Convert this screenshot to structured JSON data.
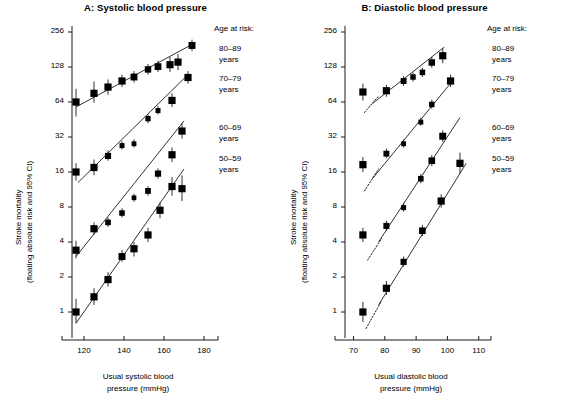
{
  "figure": {
    "ytitle_line1": "Stroke mortality",
    "ytitle_line2": "(floating absolute risk and 95% CI)",
    "legend_heading": "Age at risk:"
  },
  "panels": [
    {
      "id": "A",
      "title": "A: Systolic blood pressure",
      "xtitle_line1": "Usual systolic blood",
      "xtitle_line2": "pressure (mmHg)",
      "xticks": [
        120,
        140,
        160,
        180
      ],
      "yticks": [
        256,
        128,
        64,
        32,
        16,
        8,
        4,
        2,
        1
      ]
    },
    {
      "id": "B",
      "title": "B: Diastolic blood pressure",
      "xtitle_line1": "Usual diastolic blood",
      "xtitle_line2": "pressure (mmHg)",
      "xticks": [
        70,
        80,
        90,
        100,
        110
      ],
      "yticks": [
        256,
        128,
        64,
        32,
        16,
        8,
        4,
        2,
        1
      ]
    }
  ],
  "legend": [
    {
      "range": "80–89",
      "unit": "years"
    },
    {
      "range": "70–79",
      "unit": "years"
    },
    {
      "range": "60–69",
      "unit": "years"
    },
    {
      "range": "50–59",
      "unit": "years"
    }
  ],
  "chart_data": {
    "type": "scatter",
    "ylabel": "Stroke mortality (floating absolute risk and 95% CI)",
    "yscale": "log2",
    "ylim": [
      0.75,
      330
    ],
    "yticks": [
      1,
      2,
      4,
      8,
      16,
      32,
      64,
      128,
      256
    ],
    "grid": false,
    "legend_position": "right",
    "panels": [
      {
        "id": "A",
        "title": "A: Systolic blood pressure",
        "xlabel": "Usual systolic blood pressure (mmHg)",
        "xlim": [
          112,
          184
        ],
        "xticks": [
          120,
          140,
          160,
          180
        ],
        "series": [
          {
            "name": "80–89 years",
            "fit_line": {
              "x": [
                116,
                174
              ],
              "y": [
                58,
                200
              ]
            },
            "points": [
              {
                "x": 116,
                "y": 64,
                "ci_low": 48,
                "ci_high": 83
              },
              {
                "x": 125,
                "y": 76,
                "ci_low": 63,
                "ci_high": 96
              },
              {
                "x": 132,
                "y": 86,
                "ci_low": 74,
                "ci_high": 100
              },
              {
                "x": 139,
                "y": 97,
                "ci_low": 86,
                "ci_high": 110
              },
              {
                "x": 145,
                "y": 105,
                "ci_low": 94,
                "ci_high": 118
              },
              {
                "x": 152,
                "y": 122,
                "ci_low": 110,
                "ci_high": 136
              },
              {
                "x": 157,
                "y": 129,
                "ci_low": 116,
                "ci_high": 145
              },
              {
                "x": 163,
                "y": 134,
                "ci_low": 116,
                "ci_high": 156
              },
              {
                "x": 167,
                "y": 141,
                "ci_low": 120,
                "ci_high": 165
              },
              {
                "x": 174,
                "y": 196,
                "ci_low": 175,
                "ci_high": 220
              }
            ]
          },
          {
            "name": "70–79 years",
            "fit_line": {
              "x": [
                117,
                172
              ],
              "y": [
                13,
                110
              ]
            },
            "points": [
              {
                "x": 116,
                "y": 16,
                "ci_low": 13.5,
                "ci_high": 19
              },
              {
                "x": 125,
                "y": 17.5,
                "ci_low": 15,
                "ci_high": 20.5
              },
              {
                "x": 132,
                "y": 22,
                "ci_low": 20,
                "ci_high": 24.5
              },
              {
                "x": 139,
                "y": 27,
                "ci_low": 25,
                "ci_high": 29.5
              },
              {
                "x": 145,
                "y": 28,
                "ci_low": 26,
                "ci_high": 30.5
              },
              {
                "x": 152,
                "y": 46,
                "ci_low": 42,
                "ci_high": 50
              },
              {
                "x": 157,
                "y": 54,
                "ci_low": 50,
                "ci_high": 59
              },
              {
                "x": 164,
                "y": 66,
                "ci_low": 58,
                "ci_high": 76
              },
              {
                "x": 172,
                "y": 104,
                "ci_low": 92,
                "ci_high": 118
              }
            ]
          },
          {
            "name": "60–69 years",
            "fit_line": {
              "x": [
                116,
                170
              ],
              "y": [
                3.0,
                44
              ]
            },
            "points": [
              {
                "x": 116,
                "y": 3.4,
                "ci_low": 2.9,
                "ci_high": 4.1
              },
              {
                "x": 125,
                "y": 5.2,
                "ci_low": 4.6,
                "ci_high": 5.9
              },
              {
                "x": 132,
                "y": 5.9,
                "ci_low": 5.4,
                "ci_high": 6.5
              },
              {
                "x": 139,
                "y": 7.1,
                "ci_low": 6.5,
                "ci_high": 7.8
              },
              {
                "x": 145,
                "y": 9.6,
                "ci_low": 8.9,
                "ci_high": 10.4
              },
              {
                "x": 152,
                "y": 11.0,
                "ci_low": 10.0,
                "ci_high": 12.1
              },
              {
                "x": 157,
                "y": 15.5,
                "ci_low": 14.0,
                "ci_high": 17.2
              },
              {
                "x": 164,
                "y": 22.5,
                "ci_low": 19.5,
                "ci_high": 26.0
              },
              {
                "x": 169,
                "y": 36,
                "ci_low": 31,
                "ci_high": 42
              }
            ]
          },
          {
            "name": "50–59 years",
            "fit_line": {
              "x": [
                116,
                170
              ],
              "y": [
                0.8,
                17
              ]
            },
            "points": [
              {
                "x": 116,
                "y": 1.0,
                "ci_low": 0.8,
                "ci_high": 1.3
              },
              {
                "x": 125,
                "y": 1.35,
                "ci_low": 1.15,
                "ci_high": 1.6
              },
              {
                "x": 132,
                "y": 1.9,
                "ci_low": 1.65,
                "ci_high": 2.2
              },
              {
                "x": 139,
                "y": 3.0,
                "ci_low": 2.7,
                "ci_high": 3.4
              },
              {
                "x": 145,
                "y": 3.5,
                "ci_low": 3.0,
                "ci_high": 4.0
              },
              {
                "x": 152,
                "y": 4.6,
                "ci_low": 4.0,
                "ci_high": 5.3
              },
              {
                "x": 158,
                "y": 7.5,
                "ci_low": 6.4,
                "ci_high": 8.8
              },
              {
                "x": 164,
                "y": 12.0,
                "ci_low": 10.0,
                "ci_high": 14.5
              },
              {
                "x": 169,
                "y": 11.5,
                "ci_low": 9.0,
                "ci_high": 15.0
              }
            ]
          }
        ]
      },
      {
        "id": "B",
        "title": "B: Diastolic blood pressure",
        "xlabel": "Usual diastolic blood pressure (mmHg)",
        "xlim": [
          66,
          112
        ],
        "xticks": [
          70,
          80,
          90,
          100,
          110
        ],
        "series": [
          {
            "name": "80–89 years",
            "fit_line": {
              "x": [
                76,
                99
              ],
              "y": [
                62,
                190
              ]
            },
            "fit_dotted": {
              "x": [
                73.5,
                78
              ],
              "y": [
                52,
                72
              ]
            },
            "points": [
              {
                "x": 73,
                "y": 78,
                "ci_low": 66,
                "ci_high": 92
              },
              {
                "x": 80.5,
                "y": 80,
                "ci_low": 71,
                "ci_high": 90
              },
              {
                "x": 86,
                "y": 97,
                "ci_low": 88,
                "ci_high": 107
              },
              {
                "x": 89,
                "y": 105,
                "ci_low": 96,
                "ci_high": 115
              },
              {
                "x": 92,
                "y": 115,
                "ci_low": 105,
                "ci_high": 126
              },
              {
                "x": 95,
                "y": 140,
                "ci_low": 126,
                "ci_high": 156
              },
              {
                "x": 98.5,
                "y": 160,
                "ci_low": 138,
                "ci_high": 186
              }
            ]
          },
          {
            "name": "70–79 years",
            "fit_line": {
              "x": [
                76,
                102
              ],
              "y": [
                14,
                100
              ]
            },
            "fit_dotted": {
              "x": [
                73.5,
                78
              ],
              "y": [
                11,
                17
              ]
            },
            "points": [
              {
                "x": 73,
                "y": 18.5,
                "ci_low": 16.0,
                "ci_high": 21.5
              },
              {
                "x": 80.5,
                "y": 23,
                "ci_low": 21.0,
                "ci_high": 25.5
              },
              {
                "x": 86,
                "y": 28,
                "ci_low": 26.0,
                "ci_high": 30.5
              },
              {
                "x": 91.5,
                "y": 43,
                "ci_low": 40.0,
                "ci_high": 47.0
              },
              {
                "x": 95,
                "y": 61,
                "ci_low": 56.0,
                "ci_high": 67.0
              },
              {
                "x": 101,
                "y": 97,
                "ci_low": 86.0,
                "ci_high": 110.0
              }
            ]
          },
          {
            "name": "60–69 years",
            "fit_line": {
              "x": [
                78,
                104
              ],
              "y": [
                4.0,
                47
              ]
            },
            "fit_dotted": {
              "x": [
                74.5,
                79
              ],
              "y": [
                2.8,
                4.3
              ]
            },
            "points": [
              {
                "x": 73,
                "y": 4.6,
                "ci_low": 4.0,
                "ci_high": 5.3
              },
              {
                "x": 80.5,
                "y": 5.5,
                "ci_low": 5.0,
                "ci_high": 6.1
              },
              {
                "x": 86,
                "y": 7.9,
                "ci_low": 7.3,
                "ci_high": 8.6
              },
              {
                "x": 91.5,
                "y": 14.0,
                "ci_low": 12.8,
                "ci_high": 15.4
              },
              {
                "x": 95,
                "y": 20.0,
                "ci_low": 18.0,
                "ci_high": 22.4
              },
              {
                "x": 98.5,
                "y": 32.5,
                "ci_low": 29.0,
                "ci_high": 36.5
              }
            ]
          },
          {
            "name": "50–59 years",
            "fit_line": {
              "x": [
                78,
                106
              ],
              "y": [
                1.15,
                19
              ]
            },
            "fit_dotted": {
              "x": [
                74,
                79
              ],
              "y": [
                0.72,
                1.25
              ]
            },
            "points": [
              {
                "x": 73,
                "y": 1.0,
                "ci_low": 0.82,
                "ci_high": 1.22
              },
              {
                "x": 80.5,
                "y": 1.6,
                "ci_low": 1.4,
                "ci_high": 1.85
              },
              {
                "x": 86,
                "y": 2.7,
                "ci_low": 2.45,
                "ci_high": 3.0
              },
              {
                "x": 92,
                "y": 5.0,
                "ci_low": 4.5,
                "ci_high": 5.6
              },
              {
                "x": 98,
                "y": 9.0,
                "ci_low": 7.9,
                "ci_high": 10.3
              },
              {
                "x": 104,
                "y": 19.0,
                "ci_low": 15.5,
                "ci_high": 23.5
              }
            ]
          }
        ]
      }
    ]
  }
}
